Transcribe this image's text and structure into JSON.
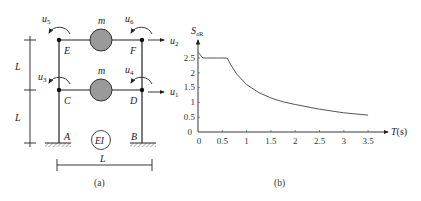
{
  "figure_a": {
    "caption": "(a)",
    "nodes": {
      "E": "E",
      "F": "F",
      "C": "C",
      "D": "D",
      "A": "A",
      "B": "B"
    },
    "mass_label": "m",
    "stiffness_label": "EI",
    "dim_height_label": "L",
    "dim_width_label": "L",
    "dofs": {
      "u1": "u",
      "u2": "u",
      "u3": "u",
      "u4": "u",
      "u5": "u",
      "u6": "u"
    },
    "dof_subscripts": {
      "u1": "1",
      "u2": "2",
      "u3": "3",
      "u4": "4",
      "u5": "5",
      "u6": "6"
    },
    "mass_color": "#9a9a9a"
  },
  "figure_b": {
    "caption": "(b)",
    "ylabel_main": "S",
    "ylabel_sub": "aR",
    "xlabel_main": "T",
    "xlabel_unit": "(s)",
    "xticks": [
      "0",
      "0.5",
      "1",
      "1.5",
      "2",
      "2.5",
      "3",
      "3.5"
    ],
    "yticks": [
      "0",
      "0.5",
      "1",
      "1.5",
      "2",
      "2.5"
    ]
  },
  "chart_data": {
    "type": "line",
    "title": "",
    "xlabel": "T(s)",
    "ylabel": "S_aR",
    "xlim": [
      0,
      3.8
    ],
    "ylim": [
      0,
      2.8
    ],
    "grid": false,
    "series": [
      {
        "name": "S_aR",
        "x": [
          0,
          0.1,
          0.2,
          0.4,
          0.6,
          0.7,
          0.8,
          1.0,
          1.25,
          1.5,
          1.75,
          2.0,
          2.5,
          3.0,
          3.5
        ],
        "values": [
          2.7,
          2.5,
          2.5,
          2.5,
          2.5,
          2.2,
          1.95,
          1.6,
          1.33,
          1.15,
          1.02,
          0.93,
          0.77,
          0.65,
          0.57
        ]
      }
    ]
  }
}
